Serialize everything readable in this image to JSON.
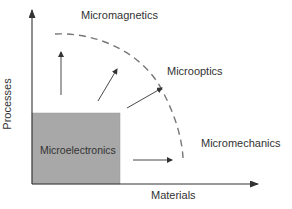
{
  "diagram": {
    "title": "",
    "axes": {
      "x_label": "Materials",
      "y_label": "Processes"
    },
    "core_region": {
      "label": "Microelectronics",
      "fill_color": "#a8a8a8"
    },
    "frontier_regions": [
      {
        "label": "Micromagnetics"
      },
      {
        "label": "Microoptics"
      },
      {
        "label": "Micromechanics"
      }
    ],
    "arrows": [
      {
        "direction": "up",
        "meaning": "toward Micromagnetics"
      },
      {
        "direction": "up-right",
        "meaning": "toward Micromagnetics/Microoptics"
      },
      {
        "direction": "up-right",
        "meaning": "toward Microoptics"
      },
      {
        "direction": "right",
        "meaning": "toward Micromechanics"
      }
    ],
    "boundary": {
      "style": "dashed-arc",
      "color": "#777777"
    },
    "colors": {
      "axis": "#333333",
      "arrow": "#333333",
      "text": "#333333"
    }
  }
}
